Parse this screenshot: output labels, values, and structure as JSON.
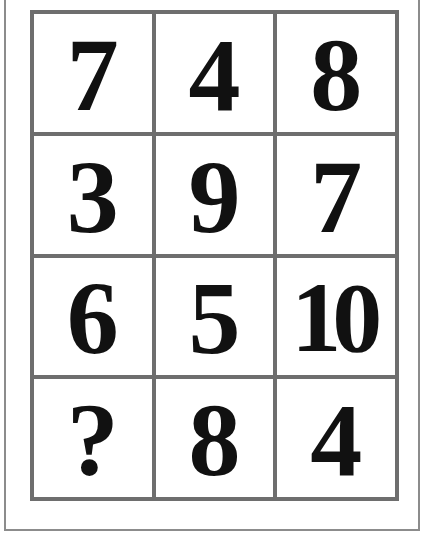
{
  "puzzle": {
    "rows": [
      [
        "7",
        "4",
        "8"
      ],
      [
        "3",
        "9",
        "7"
      ],
      [
        "6",
        "5",
        "10"
      ],
      [
        "?",
        "8",
        "4"
      ]
    ],
    "missing_symbol": "?"
  },
  "colors": {
    "grid_lines": "#6e6e6e",
    "frame": "#8c8c8c",
    "digits": "#111111",
    "background": "#ffffff"
  }
}
